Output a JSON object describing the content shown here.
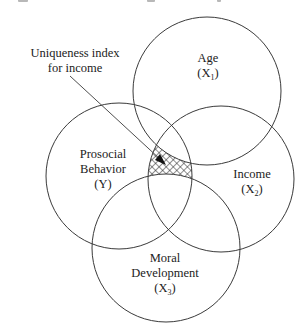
{
  "diagram": {
    "type": "venn",
    "annotation": {
      "line1": "Uniqueness index",
      "line2": "for income"
    },
    "circles": [
      {
        "id": "age",
        "label": "Age",
        "symbol": "(X",
        "subscript": "1",
        "close": ")",
        "cx": 207,
        "cy": 91,
        "r": 74
      },
      {
        "id": "prosocial",
        "label1": "Prosocial",
        "label2": "Behavior",
        "symbol": "(Y)",
        "cx": 119,
        "cy": 176,
        "r": 73
      },
      {
        "id": "income",
        "label": "Income",
        "symbol": "(X",
        "subscript": "2",
        "close": ")",
        "cx": 221,
        "cy": 179,
        "r": 73
      },
      {
        "id": "moral",
        "label1": "Moral",
        "label2": "Development",
        "symbol": "(X",
        "subscript": "3",
        "close": ")",
        "cx": 166,
        "cy": 248,
        "r": 74
      }
    ],
    "hatched_region": "Income ∩ Prosocial Behavior, excluding Age and Moral Development",
    "colors": {
      "stroke": "#3a3a3a",
      "text": "#222222",
      "background": "#ffffff"
    }
  }
}
